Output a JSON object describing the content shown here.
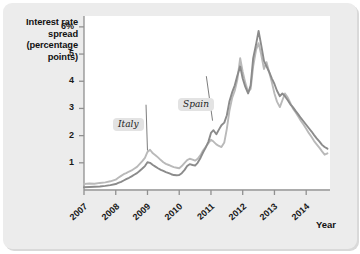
{
  "figure": {
    "panel_color": "#ececec",
    "plot_bg": "#ffffff"
  },
  "axis": {
    "y_title_lines": [
      "Interest rate",
      "spread",
      "(percentage",
      "points)"
    ],
    "y_tick_labels": [
      "6%",
      "5",
      "4",
      "3",
      "2",
      "1"
    ],
    "x_tick_labels": [
      "2007",
      "2008",
      "2009",
      "2010",
      "2011",
      "2012",
      "2013",
      "2014"
    ],
    "x_title": "Year"
  },
  "annotations": {
    "italy_label": "Italy",
    "spain_label": "Spain"
  },
  "chart_data": {
    "type": "line",
    "title": "",
    "subtitle": "",
    "xlabel": "Year",
    "ylabel": "Interest rate spread (percentage points)",
    "xlim": [
      2007.0,
      2014.75
    ],
    "ylim": [
      0,
      6.4
    ],
    "y_ticks": [
      1,
      2,
      3,
      4,
      5,
      6
    ],
    "y_tick_labels": [
      "1",
      "2",
      "3",
      "4",
      "5",
      "6%"
    ],
    "x_ticks": [
      2007,
      2008,
      2009,
      2010,
      2011,
      2012,
      2013,
      2014
    ],
    "grid": false,
    "legend": "inline-callouts",
    "legend_position": "in-plot",
    "annotations": [
      {
        "text": "Italy",
        "x": 2008.45,
        "y": 3.1,
        "points_to": {
          "x": 2009.0,
          "y": 1.45
        }
      },
      {
        "text": "Spain",
        "x": 2010.35,
        "y": 4.15,
        "points_to": {
          "x": 2011.05,
          "y": 2.55
        }
      }
    ],
    "series": [
      {
        "name": "Italy",
        "color": "#b9b9b9",
        "x": [
          2007.0,
          2007.17,
          2007.33,
          2007.5,
          2007.67,
          2007.83,
          2008.0,
          2008.08,
          2008.17,
          2008.25,
          2008.33,
          2008.42,
          2008.5,
          2008.58,
          2008.67,
          2008.75,
          2008.83,
          2008.92,
          2009.0,
          2009.08,
          2009.17,
          2009.25,
          2009.33,
          2009.42,
          2009.5,
          2009.58,
          2009.67,
          2009.75,
          2009.83,
          2009.92,
          2010.0,
          2010.08,
          2010.17,
          2010.25,
          2010.33,
          2010.42,
          2010.5,
          2010.58,
          2010.67,
          2010.75,
          2010.83,
          2010.92,
          2011.0,
          2011.08,
          2011.17,
          2011.25,
          2011.33,
          2011.42,
          2011.5,
          2011.58,
          2011.67,
          2011.75,
          2011.83,
          2011.92,
          2012.0,
          2012.08,
          2012.17,
          2012.25,
          2012.33,
          2012.42,
          2012.5,
          2012.58,
          2012.67,
          2012.75,
          2012.83,
          2012.92,
          2013.0,
          2013.08,
          2013.17,
          2013.25,
          2013.33,
          2013.42,
          2013.5,
          2013.58,
          2013.67,
          2013.75,
          2013.83,
          2013.92,
          2014.0,
          2014.08,
          2014.17,
          2014.25,
          2014.33,
          2014.42,
          2014.5,
          2014.58,
          2014.67
        ],
        "y": [
          0.22,
          0.24,
          0.23,
          0.26,
          0.28,
          0.32,
          0.38,
          0.45,
          0.52,
          0.58,
          0.62,
          0.68,
          0.72,
          0.78,
          0.85,
          0.95,
          1.05,
          1.18,
          1.4,
          1.48,
          1.35,
          1.28,
          1.2,
          1.1,
          1.02,
          0.96,
          0.92,
          0.88,
          0.84,
          0.82,
          0.8,
          0.88,
          1.0,
          1.1,
          1.15,
          1.12,
          1.08,
          1.15,
          1.28,
          1.45,
          1.58,
          1.72,
          1.85,
          1.78,
          1.68,
          1.62,
          1.58,
          1.75,
          2.25,
          2.9,
          3.4,
          3.65,
          4.05,
          4.85,
          4.35,
          3.95,
          3.6,
          3.72,
          4.55,
          5.15,
          5.4,
          5.0,
          4.45,
          4.7,
          4.35,
          3.95,
          3.55,
          3.25,
          3.05,
          3.3,
          3.55,
          3.4,
          3.2,
          3.0,
          2.85,
          2.7,
          2.55,
          2.4,
          2.25,
          2.1,
          1.95,
          1.8,
          1.68,
          1.55,
          1.42,
          1.3,
          1.35
        ]
      },
      {
        "name": "Spain",
        "color": "#8b8b8b",
        "x": [
          2007.0,
          2007.17,
          2007.33,
          2007.5,
          2007.67,
          2007.83,
          2008.0,
          2008.08,
          2008.17,
          2008.25,
          2008.33,
          2008.42,
          2008.5,
          2008.58,
          2008.67,
          2008.75,
          2008.83,
          2008.92,
          2009.0,
          2009.08,
          2009.17,
          2009.25,
          2009.33,
          2009.42,
          2009.5,
          2009.58,
          2009.67,
          2009.75,
          2009.83,
          2009.92,
          2010.0,
          2010.08,
          2010.17,
          2010.25,
          2010.33,
          2010.42,
          2010.5,
          2010.58,
          2010.67,
          2010.75,
          2010.83,
          2010.92,
          2011.0,
          2011.08,
          2011.17,
          2011.25,
          2011.33,
          2011.42,
          2011.5,
          2011.58,
          2011.67,
          2011.75,
          2011.83,
          2011.92,
          2012.0,
          2012.08,
          2012.17,
          2012.25,
          2012.33,
          2012.42,
          2012.5,
          2012.58,
          2012.67,
          2012.75,
          2012.83,
          2012.92,
          2013.0,
          2013.08,
          2013.17,
          2013.25,
          2013.33,
          2013.42,
          2013.5,
          2013.58,
          2013.67,
          2013.75,
          2013.83,
          2013.92,
          2014.0,
          2014.08,
          2014.17,
          2014.25,
          2014.33,
          2014.42,
          2014.5,
          2014.58,
          2014.67
        ],
        "y": [
          0.1,
          0.11,
          0.12,
          0.13,
          0.15,
          0.18,
          0.22,
          0.26,
          0.3,
          0.35,
          0.4,
          0.45,
          0.5,
          0.56,
          0.62,
          0.7,
          0.78,
          0.88,
          1.02,
          1.0,
          0.92,
          0.86,
          0.8,
          0.74,
          0.7,
          0.66,
          0.62,
          0.58,
          0.55,
          0.54,
          0.55,
          0.62,
          0.74,
          0.88,
          0.95,
          0.92,
          0.9,
          1.0,
          1.18,
          1.38,
          1.55,
          1.78,
          2.1,
          2.2,
          2.05,
          2.22,
          2.38,
          2.48,
          2.75,
          3.25,
          3.6,
          3.85,
          4.2,
          4.55,
          4.1,
          3.8,
          3.55,
          3.85,
          4.85,
          5.35,
          5.85,
          5.35,
          4.75,
          4.55,
          4.35,
          4.1,
          3.9,
          3.65,
          3.45,
          3.55,
          3.45,
          3.3,
          3.15,
          3.05,
          2.9,
          2.78,
          2.65,
          2.52,
          2.4,
          2.28,
          2.15,
          2.02,
          1.9,
          1.78,
          1.66,
          1.58,
          1.52
        ]
      }
    ]
  }
}
